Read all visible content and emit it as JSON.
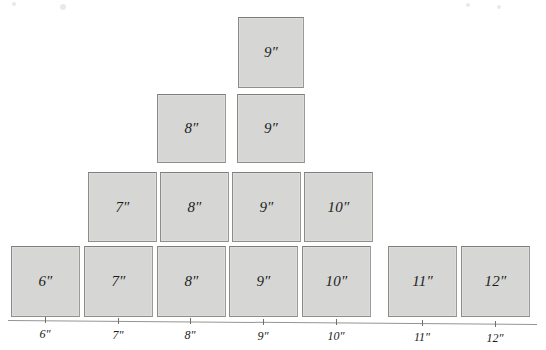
{
  "figure": {
    "fill_color": "#d6d6d4",
    "border_color": "#8e8e8c",
    "axis_color": "#949492",
    "text_color": "#1c1c1c"
  },
  "rows": [
    {
      "row_name": "row-top",
      "blocks": [
        {
          "label": "9″",
          "x": 238,
          "y": 17,
          "w": 66,
          "h": 71
        }
      ]
    },
    {
      "row_name": "row-second",
      "blocks": [
        {
          "label": "8″",
          "x": 157,
          "y": 94,
          "w": 69,
          "h": 69
        },
        {
          "label": "9″",
          "x": 237,
          "y": 94,
          "w": 68,
          "h": 69
        }
      ]
    },
    {
      "row_name": "row-third",
      "blocks": [
        {
          "label": "7″",
          "x": 88,
          "y": 172,
          "w": 69,
          "h": 70
        },
        {
          "label": "8″",
          "x": 160,
          "y": 172,
          "w": 69,
          "h": 70
        },
        {
          "label": "9″",
          "x": 232,
          "y": 172,
          "w": 69,
          "h": 70
        },
        {
          "label": "10″",
          "x": 304,
          "y": 172,
          "w": 69,
          "h": 70
        }
      ]
    },
    {
      "row_name": "row-bottom",
      "blocks": [
        {
          "label": "6″",
          "x": 11,
          "y": 246,
          "w": 69,
          "h": 71
        },
        {
          "label": "7″",
          "x": 84,
          "y": 246,
          "w": 69,
          "h": 71
        },
        {
          "label": "8″",
          "x": 157,
          "y": 246,
          "w": 69,
          "h": 71
        },
        {
          "label": "9″",
          "x": 229,
          "y": 246,
          "w": 69,
          "h": 71
        },
        {
          "label": "10″",
          "x": 302,
          "y": 246,
          "w": 69,
          "h": 71
        },
        {
          "label": "11″",
          "x": 388,
          "y": 246,
          "w": 69,
          "h": 71
        },
        {
          "label": "12″",
          "x": 461,
          "y": 246,
          "w": 69,
          "h": 71
        }
      ]
    }
  ],
  "axis": {
    "line": {
      "x1": 8,
      "y1": 320,
      "x2": 537,
      "y2": 324
    },
    "ticks": [
      {
        "label": "6″",
        "x": 45,
        "y": 321
      },
      {
        "label": "7″",
        "x": 118,
        "y": 322
      },
      {
        "label": "8″",
        "x": 190,
        "y": 322
      },
      {
        "label": "9″",
        "x": 263,
        "y": 323
      },
      {
        "label": "10″",
        "x": 336,
        "y": 323
      },
      {
        "label": "11″",
        "x": 422,
        "y": 324
      },
      {
        "label": "12″",
        "x": 495,
        "y": 325
      }
    ],
    "tick_label_offset_y": 7
  },
  "speckles": [
    {
      "x": 12,
      "y": 2,
      "r": 2
    },
    {
      "x": 60,
      "y": 4,
      "r": 3
    },
    {
      "x": 466,
      "y": 3,
      "r": 2
    },
    {
      "x": 497,
      "y": 5,
      "r": 2
    }
  ]
}
